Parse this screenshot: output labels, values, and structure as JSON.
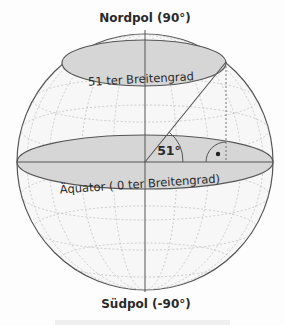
{
  "diagram": {
    "type": "globe-latitude-illustration",
    "labels": {
      "north_pole": "Nordpol (90°)",
      "south_pole": "Südpol (-90°)",
      "latitude_circle": "51 ter Breitengrad",
      "equator": "Äquator ( 0 ter Breitengrad)",
      "angle": "51°",
      "right_angle_marker": "•"
    },
    "colors": {
      "outline": "#555555",
      "fill_band": "#d4d4d4",
      "grid": "#b8b8b8",
      "background": "#fdfdfd",
      "text": "#2a2a2a"
    }
  }
}
